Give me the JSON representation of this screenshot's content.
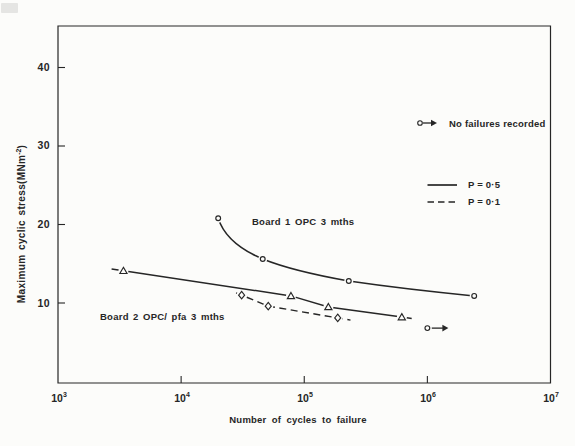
{
  "figure": {
    "background_color": "#fcfcfa",
    "ink_color": "#262626"
  },
  "chart_data": {
    "type": "line",
    "title": "",
    "xlabel": "Number of cycles to failure",
    "ylabel": "Maximum cyclic stress(MNm⁻²)",
    "ylabel_parts": {
      "pre": "Maximum cyclic stress(MNm",
      "sup": "-2",
      "post": ")"
    },
    "x_scale": "log",
    "y_scale": "linear",
    "x_range": [
      1000,
      10000000
    ],
    "y_range": [
      0,
      45.5
    ],
    "grid": false,
    "x_ticks": [
      {
        "base": "10",
        "sup": "3",
        "value": 1000,
        "tick": false
      },
      {
        "base": "10",
        "sup": "4",
        "value": 10000,
        "tick": true
      },
      {
        "base": "10",
        "sup": "5",
        "value": 100000,
        "tick": true
      },
      {
        "base": "10",
        "sup": "6",
        "value": 1000000,
        "tick": true
      },
      {
        "base": "10",
        "sup": "7",
        "value": 10000000,
        "tick": false
      }
    ],
    "y_ticks": [
      {
        "label": "40",
        "value": 40
      },
      {
        "label": "30",
        "value": 30
      },
      {
        "label": "20",
        "value": 20
      },
      {
        "label": "10",
        "value": 10
      }
    ],
    "series": [
      {
        "id": "board1",
        "name": "Board 1 OPC 3 mths",
        "probability": "P = 0·5",
        "line": "solid",
        "marker": "circle",
        "points": [
          [
            20000,
            20.8
          ],
          [
            46000,
            15.6
          ],
          [
            230000,
            12.8
          ],
          [
            2400000,
            10.9
          ]
        ]
      },
      {
        "id": "board2-p05",
        "name": "Board 2 OPC/ pfa 3 mths (P = 0·5)",
        "probability": "P = 0·5",
        "line": "solid",
        "marker": "triangle",
        "points": [
          [
            3400,
            14.1
          ],
          [
            78000,
            10.9
          ],
          [
            157000,
            9.5
          ],
          [
            620000,
            8.2
          ]
        ]
      },
      {
        "id": "board2-p01",
        "name": "Board 2 OPC/ pfa 3 mths (P = 0·1)",
        "probability": "P = 0·1",
        "line": "dashed",
        "marker": "diamond",
        "points": [
          [
            31000,
            11.0
          ],
          [
            51000,
            9.6
          ],
          [
            187000,
            8.1
          ]
        ]
      },
      {
        "id": "runout",
        "name": "No failures recorded (run-out)",
        "line": "none",
        "marker": "circle-arrow",
        "points": [
          [
            1000000,
            6.8
          ]
        ]
      }
    ],
    "annotations": [
      {
        "id": "board1-label",
        "text": "Board 1 OPC 3 mths"
      },
      {
        "id": "board2-label",
        "text": "Board 2 OPC/ pfa 3 mths"
      }
    ],
    "legend": {
      "position": "upper-right",
      "items": [
        {
          "symbol": "circle-arrow",
          "label": "No failures recorded"
        },
        {
          "symbol": "solid-line",
          "label": "P = 0·5"
        },
        {
          "symbol": "dashed-line",
          "label": "P = 0·1"
        }
      ]
    }
  }
}
